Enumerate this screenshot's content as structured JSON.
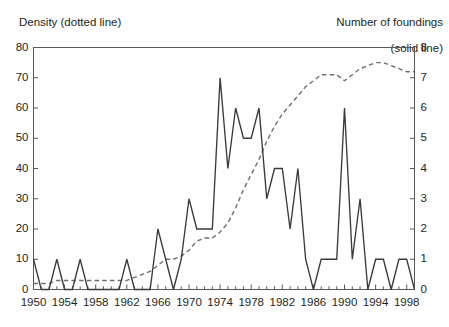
{
  "header": {
    "left_label": "Density (dotted line)",
    "right_label_line1": "Number of foundings",
    "right_label_line2": "(solid line)"
  },
  "axis": {
    "left_ticks": [
      "0",
      "10",
      "20",
      "30",
      "40",
      "50",
      "60",
      "70",
      "80"
    ],
    "right_ticks": [
      "0",
      "1",
      "2",
      "3",
      "4",
      "5",
      "6",
      "7",
      "8"
    ],
    "x_ticks": [
      "1950",
      "1954",
      "1958",
      "1962",
      "1966",
      "1970",
      "1974",
      "1978",
      "1982",
      "1986",
      "1990",
      "1994",
      "1998"
    ]
  },
  "colors": {
    "frame": "#58595b",
    "solid_line": "#3a3a3c",
    "dotted_line": "#6d6e71",
    "text": "#231f20",
    "background": "#ffffff"
  },
  "chart_data": {
    "type": "line",
    "title": "",
    "xlabel": "",
    "ylabel": "Density (dotted line)",
    "y2label": "Number of foundings (solid line)",
    "grid": false,
    "legend": "inline-axis-labels",
    "xlim": [
      1950,
      1999
    ],
    "ylim": [
      0,
      80
    ],
    "y2lim": [
      0,
      8
    ],
    "x": [
      1950,
      1951,
      1952,
      1953,
      1954,
      1955,
      1956,
      1957,
      1958,
      1959,
      1960,
      1961,
      1962,
      1963,
      1964,
      1965,
      1966,
      1967,
      1968,
      1969,
      1970,
      1971,
      1972,
      1973,
      1974,
      1975,
      1976,
      1977,
      1978,
      1979,
      1980,
      1981,
      1982,
      1983,
      1984,
      1985,
      1986,
      1987,
      1988,
      1989,
      1990,
      1991,
      1992,
      1993,
      1994,
      1995,
      1996,
      1997,
      1998,
      1999
    ],
    "series": [
      {
        "name": "Number of foundings (solid line)",
        "axis": "right",
        "unit": "foundings",
        "values": [
          1,
          0,
          0,
          1,
          0,
          0,
          1,
          0,
          0,
          0,
          0,
          0,
          1,
          0,
          0,
          0,
          2,
          1,
          0,
          1,
          3,
          2,
          2,
          2,
          7,
          4,
          6,
          5,
          5,
          6,
          3,
          4,
          4,
          2,
          4,
          1,
          0,
          1,
          1,
          1,
          6,
          1,
          3,
          0,
          1,
          1,
          0,
          1,
          1,
          0
        ]
      },
      {
        "name": "Density (dotted line)",
        "axis": "left",
        "unit": "organizations",
        "values": [
          2,
          2,
          2,
          3,
          3,
          3,
          3,
          3,
          3,
          3,
          3,
          3,
          3,
          4,
          5,
          6,
          8,
          10,
          10,
          11,
          13,
          16,
          17,
          17,
          19,
          22,
          27,
          33,
          38,
          43,
          49,
          54,
          58,
          61,
          64,
          67,
          69,
          71,
          71,
          71,
          69,
          71,
          73,
          74,
          75,
          75,
          74,
          73,
          72,
          72
        ]
      }
    ]
  }
}
